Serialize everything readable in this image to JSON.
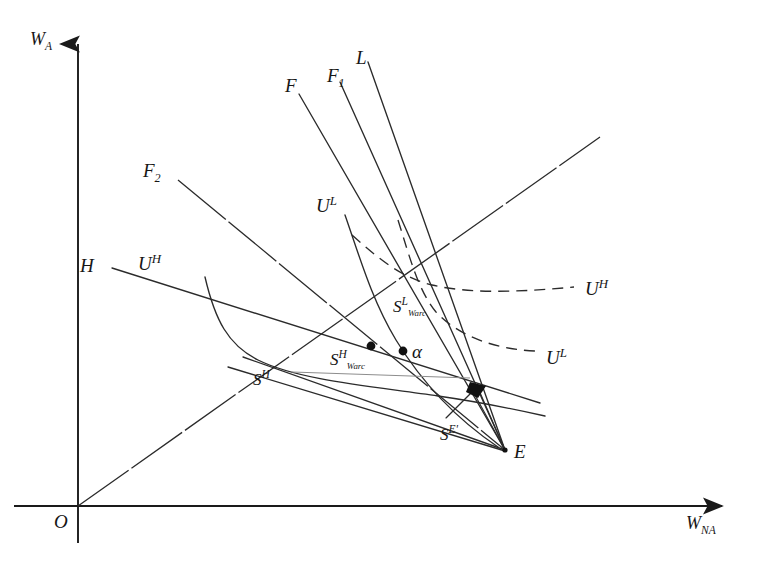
{
  "figure": {
    "background_color": "#ffffff",
    "ink_color": "#1a1a1a",
    "width": 763,
    "height": 581
  },
  "axes": {
    "y_axis": {
      "label_main": "W",
      "label_sub": "A",
      "x": 78,
      "top": 38,
      "bottom": 540
    },
    "x_axis": {
      "label_main": "W",
      "label_sub": "NA",
      "y": 506,
      "left": 14,
      "right": 730
    },
    "origin": {
      "label": "O",
      "x": 78,
      "y": 506
    }
  },
  "labels": [
    {
      "id": "w-a",
      "name": "y-axis-label",
      "main": "W",
      "sub": "A",
      "sup": "",
      "supsub": "",
      "x": 30,
      "y": 30,
      "size": "lbl-axis"
    },
    {
      "id": "w-na",
      "name": "x-axis-label",
      "main": "W",
      "sub": "NA",
      "sup": "",
      "supsub": "",
      "x": 686,
      "y": 514,
      "size": "lbl-axis"
    },
    {
      "id": "origin-o",
      "name": "origin-label",
      "main": "O",
      "sub": "",
      "sup": "",
      "supsub": "",
      "x": 54,
      "y": 512,
      "size": "lbl-main"
    },
    {
      "id": "line-l",
      "name": "curve-label-L",
      "main": "L",
      "sub": "",
      "sup": "",
      "supsub": "",
      "x": 356,
      "y": 48,
      "size": "lbl-main"
    },
    {
      "id": "line-f1",
      "name": "curve-label-F1",
      "main": "F",
      "sub": "1",
      "sup": "",
      "supsub": "",
      "x": 327,
      "y": 66,
      "size": "lbl-main"
    },
    {
      "id": "line-f",
      "name": "curve-label-F",
      "main": "F",
      "sub": "",
      "sup": "",
      "supsub": "",
      "x": 285,
      "y": 76,
      "size": "lbl-main"
    },
    {
      "id": "line-f2",
      "name": "curve-label-F2",
      "main": "F",
      "sub": "2",
      "sup": "",
      "supsub": "",
      "x": 143,
      "y": 161,
      "size": "lbl-main"
    },
    {
      "id": "line-h",
      "name": "curve-label-H",
      "main": "H",
      "sub": "",
      "sup": "",
      "supsub": "",
      "x": 80,
      "y": 256,
      "size": "lbl-main"
    },
    {
      "id": "curve-uh-s",
      "name": "curve-label-UH-solid",
      "main": "U",
      "sub": "",
      "sup": "H",
      "supsub": "",
      "x": 138,
      "y": 253,
      "size": "lbl-main"
    },
    {
      "id": "curve-ul-s",
      "name": "curve-label-UL-solid",
      "main": "U",
      "sub": "",
      "sup": "L",
      "supsub": "",
      "x": 316,
      "y": 195,
      "size": "lbl-main"
    },
    {
      "id": "curve-uh-d",
      "name": "curve-label-UH-dashed",
      "main": "U",
      "sub": "",
      "sup": "H",
      "supsub": "",
      "x": 585,
      "y": 278,
      "size": "lbl-main"
    },
    {
      "id": "curve-ul-d",
      "name": "curve-label-UL-dashed",
      "main": "U",
      "sub": "",
      "sup": "L",
      "supsub": "",
      "x": 546,
      "y": 347,
      "size": "lbl-main"
    },
    {
      "id": "pt-sh",
      "name": "point-label-S-H",
      "main": "S",
      "sub": "",
      "sup": "H",
      "supsub": "",
      "x": 253,
      "y": 369,
      "size": "lbl-small"
    },
    {
      "id": "pt-shw",
      "name": "point-label-S-H-Warc",
      "main": "S",
      "sub": "",
      "sup": "H",
      "supsub": "Warc",
      "x": 330,
      "y": 349,
      "size": "lbl-small"
    },
    {
      "id": "pt-slw",
      "name": "point-label-S-L-Warc",
      "main": "S",
      "sub": "",
      "sup": "L",
      "supsub": "Warc",
      "x": 393,
      "y": 296,
      "size": "lbl-small"
    },
    {
      "id": "pt-se",
      "name": "point-label-S-E-prime",
      "main": "S",
      "sub": "",
      "sup": "E'",
      "supsub": "",
      "x": 440,
      "y": 424,
      "size": "lbl-small"
    },
    {
      "id": "pt-e",
      "name": "point-label-E",
      "main": "E",
      "sub": "",
      "sup": "",
      "supsub": "",
      "x": 514,
      "y": 442,
      "size": "lbl-main"
    },
    {
      "id": "pt-alpha",
      "name": "point-label-alpha",
      "main": "α",
      "sub": "",
      "sup": "",
      "supsub": "",
      "x": 412,
      "y": 342,
      "size": "lbl-main"
    }
  ],
  "chart_data": {
    "type": "line",
    "xlabel": "W_NA",
    "ylabel": "W_A",
    "legend_position": "inline-end-labels",
    "grid": false,
    "annotations": [
      {
        "label": "E",
        "role": "equilibrium-endowment-point",
        "x": 505,
        "y": 450
      },
      {
        "label": "S^H",
        "role": "intersection-point",
        "x": 243,
        "y": 355
      },
      {
        "label": "S^{H_Warc}",
        "role": "marked-point",
        "x": 371,
        "y": 347
      },
      {
        "label": "S^{L_Warc}",
        "role": "labelled-point",
        "x": 412,
        "y": 288
      },
      {
        "label": "S^{E'}",
        "role": "labelled-point",
        "x": 470,
        "y": 400
      },
      {
        "label": "alpha",
        "role": "marked-point",
        "x": 404,
        "y": 351
      }
    ],
    "curves": [
      {
        "name": "L",
        "style": "solid",
        "from": [
          368,
          62
        ],
        "to": [
          505,
          450
        ]
      },
      {
        "name": "F1",
        "style": "solid",
        "from": [
          340,
          82
        ],
        "to": [
          505,
          450
        ]
      },
      {
        "name": "F",
        "style": "solid",
        "from": [
          299,
          94
        ],
        "to": [
          505,
          450
        ]
      },
      {
        "name": "F2",
        "style": "gapped",
        "from": [
          178,
          180
        ],
        "to": [
          505,
          450
        ]
      },
      {
        "name": "H",
        "style": "solid",
        "from": [
          112,
          268
        ],
        "to": [
          540,
          403
        ]
      },
      {
        "name": "U^H (solid)",
        "style": "solid",
        "from": [
          205,
          277
        ],
        "to": [
          545,
          415
        ]
      },
      {
        "name": "U^L (solid)",
        "style": "solid",
        "from": [
          345,
          215
        ],
        "to": [
          498,
          447
        ]
      },
      {
        "name": "U^H (dashed)",
        "style": "dashed",
        "from": [
          352,
          235
        ],
        "to": [
          575,
          287
        ]
      },
      {
        "name": "U^L (dashed)",
        "style": "dashed",
        "from": [
          398,
          220
        ],
        "to": [
          536,
          350
        ]
      },
      {
        "name": "ray from origin",
        "style": "gapped",
        "from": [
          78,
          506
        ],
        "to": [
          600,
          137
        ]
      }
    ]
  }
}
